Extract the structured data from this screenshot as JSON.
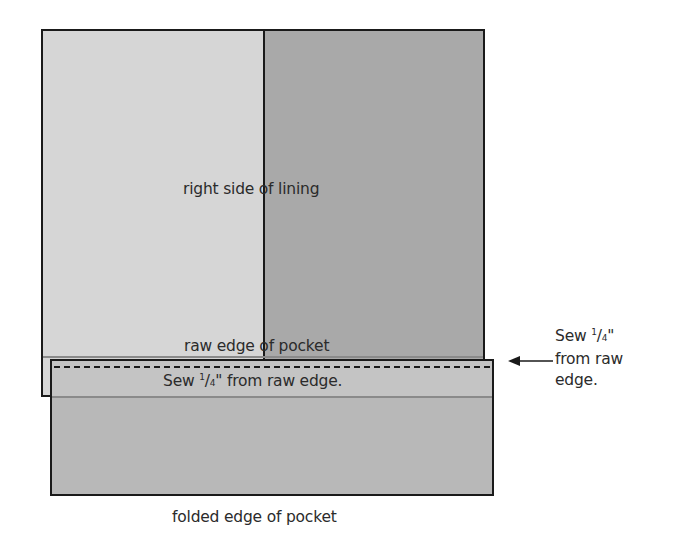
{
  "diagram": {
    "lining": {
      "label": "right side of lining",
      "left_panel_color": "#d6d6d6",
      "right_panel_color": "#a9a9a9"
    },
    "pocket": {
      "raw_edge_label": "raw edge of pocket",
      "sew_label_pre": "Sew ",
      "sew_fraction_num": "1",
      "sew_fraction_den": "4",
      "sew_label_post": "\" from raw edge.",
      "folded_edge_label": "folded edge of pocket",
      "color": "#b8b8b8",
      "stitch_style": "dashed"
    },
    "annotation": {
      "line1_pre": "Sew ",
      "line1_num": "1",
      "line1_den": "4",
      "line1_post": "\"",
      "line2": "from raw",
      "line3": "edge.",
      "arrow_direction": "left"
    }
  }
}
